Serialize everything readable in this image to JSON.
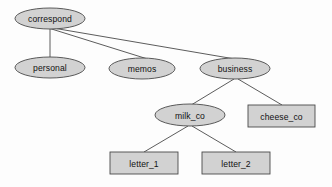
{
  "diagram": {
    "type": "tree",
    "background_color": "#fdfdfd",
    "node_fill_color": "#d2d2d2",
    "node_stroke_color": "#4a4a4a",
    "edge_color": "#4a4a4a",
    "text_color": "#111111",
    "nodes": [
      {
        "id": "correspond",
        "label": "correspond",
        "shape": "ellipse",
        "cx": 50,
        "cy": 18.5,
        "rx": 35,
        "ry": 10.5
      },
      {
        "id": "personal",
        "label": "personal",
        "shape": "ellipse",
        "cx": 50,
        "cy": 67.5,
        "rx": 35,
        "ry": 10.5
      },
      {
        "id": "memos",
        "label": "memos",
        "shape": "ellipse",
        "cx": 142,
        "cy": 68.5,
        "rx": 33,
        "ry": 10.5
      },
      {
        "id": "business",
        "label": "business",
        "shape": "ellipse",
        "cx": 235,
        "cy": 68.5,
        "rx": 35,
        "ry": 10.5
      },
      {
        "id": "milk_co",
        "label": "milk_co",
        "shape": "ellipse",
        "cx": 190,
        "cy": 115,
        "rx": 35,
        "ry": 11
      },
      {
        "id": "cheese_co",
        "label": "cheese_co",
        "shape": "rect",
        "x": 248,
        "y": 105,
        "width": 67,
        "height": 22
      },
      {
        "id": "letter_1",
        "label": "letter_1",
        "shape": "rect",
        "x": 110,
        "y": 152,
        "width": 68,
        "height": 22
      },
      {
        "id": "letter_2",
        "label": "letter_2",
        "shape": "rect",
        "x": 202,
        "y": 152,
        "width": 68,
        "height": 22
      }
    ],
    "edges": [
      {
        "id": "correspond-personal",
        "from": "correspond",
        "to": "personal",
        "x1": 50,
        "y1": 29,
        "x2": 50,
        "y2": 57
      },
      {
        "id": "correspond-memos",
        "from": "correspond",
        "to": "memos",
        "x1": 50,
        "y1": 28.5,
        "x2": 146,
        "y2": 58.5
      },
      {
        "id": "correspond-business",
        "from": "correspond",
        "to": "business",
        "x1": 50,
        "y1": 27.5,
        "x2": 232,
        "y2": 58.5
      },
      {
        "id": "business-milk_co",
        "from": "business",
        "to": "milk_co",
        "x1": 234,
        "y1": 79,
        "x2": 192,
        "y2": 104.5
      },
      {
        "id": "business-cheese_co",
        "from": "business",
        "to": "cheese_co",
        "x1": 238,
        "y1": 79,
        "x2": 282,
        "y2": 105
      },
      {
        "id": "milk_co-letter_1",
        "from": "milk_co",
        "to": "letter_1",
        "x1": 188,
        "y1": 126,
        "x2": 144,
        "y2": 152
      },
      {
        "id": "milk_co-letter_2",
        "from": "milk_co",
        "to": "letter_2",
        "x1": 192,
        "y1": 126,
        "x2": 236,
        "y2": 152
      }
    ]
  }
}
